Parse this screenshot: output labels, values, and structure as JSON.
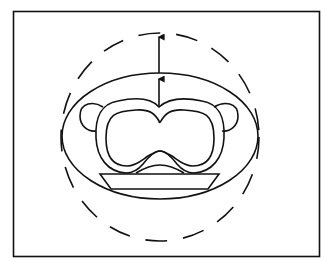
{
  "figure": {
    "elements": [
      {
        "name": "outer-frame",
        "kind": "rectangle border"
      },
      {
        "name": "dashed-boundary",
        "kind": "dashed circle"
      },
      {
        "name": "solid-ellipse-boundary",
        "kind": "ellipse"
      },
      {
        "name": "torso-outer-outline",
        "kind": "closed curve"
      },
      {
        "name": "torso-inner-outline",
        "kind": "closed curve"
      },
      {
        "name": "left-arm",
        "kind": "lobe"
      },
      {
        "name": "right-arm",
        "kind": "lobe"
      },
      {
        "name": "table",
        "kind": "trapezoid"
      },
      {
        "name": "inner-arrow",
        "kind": "up arrow"
      },
      {
        "name": "outer-arrow",
        "kind": "up arrow"
      }
    ],
    "colors": {
      "line": "#111111",
      "background": "#ffffff"
    }
  }
}
